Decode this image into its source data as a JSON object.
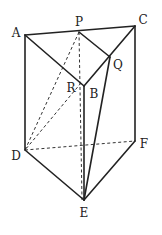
{
  "diagram": {
    "type": "geometry-prism",
    "vertices": {
      "A": {
        "x": 25,
        "y": 35
      },
      "P": {
        "x": 79,
        "y": 32
      },
      "C": {
        "x": 135,
        "y": 26
      },
      "Q": {
        "x": 110,
        "y": 57
      },
      "B": {
        "x": 84,
        "y": 86
      },
      "R": {
        "x": 81,
        "y": 83
      },
      "D": {
        "x": 25,
        "y": 150
      },
      "E": {
        "x": 84,
        "y": 200
      },
      "F": {
        "x": 135,
        "y": 141
      }
    },
    "labels": [
      {
        "text": "A",
        "x": 16,
        "y": 33
      },
      {
        "text": "P",
        "x": 79,
        "y": 22
      },
      {
        "text": "C",
        "x": 143,
        "y": 20
      },
      {
        "text": "Q",
        "x": 118,
        "y": 65
      },
      {
        "text": "R",
        "x": 71,
        "y": 88
      },
      {
        "text": "B",
        "x": 94,
        "y": 94
      },
      {
        "text": "D",
        "x": 16,
        "y": 156
      },
      {
        "text": "F",
        "x": 144,
        "y": 144
      },
      {
        "text": "E",
        "x": 84,
        "y": 213
      }
    ],
    "solid_edges": [
      [
        "A",
        "C"
      ],
      [
        "A",
        "B"
      ],
      [
        "B",
        "C"
      ],
      [
        "P",
        "Q"
      ],
      [
        "A",
        "D"
      ],
      [
        "B",
        "E"
      ],
      [
        "C",
        "F"
      ],
      [
        "D",
        "E"
      ],
      [
        "E",
        "F"
      ],
      [
        "Q",
        "E"
      ]
    ],
    "dashed_edges": [
      [
        "D",
        "F"
      ],
      [
        "P",
        "D"
      ],
      [
        "R",
        "D"
      ],
      [
        "P",
        "E"
      ]
    ],
    "colors": {
      "stroke": "#222222",
      "background": "#ffffff"
    }
  }
}
